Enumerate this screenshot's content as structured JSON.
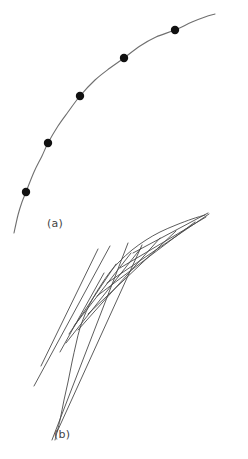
{
  "figure": {
    "title": "",
    "background_color": "#ffffff",
    "width": 248,
    "height": 459,
    "panels": [
      {
        "id": "a",
        "label": "(a)",
        "label_position": {
          "x": 47,
          "y": 217
        },
        "description": "smooth concave curve with sampled marker points"
      },
      {
        "id": "b",
        "label": "(b)",
        "label_position": {
          "x": 54,
          "y": 428
        },
        "description": "same curve approximated by overlapping tangent line segments"
      }
    ]
  },
  "chart_data": {
    "type": "line",
    "title": "",
    "xlabel": "",
    "ylabel": "",
    "grid": false,
    "legend": false,
    "axis_shown": false,
    "xlim": [
      0,
      248
    ],
    "ylim": [
      0,
      459
    ],
    "series": [
      {
        "name": "curve-a",
        "panel": "a",
        "stroke": "#6f6f6f",
        "stroke_width": 1.1,
        "kind": "smooth-curve",
        "points": [
          [
            14,
            233
          ],
          [
            18,
            215
          ],
          [
            22,
            202
          ],
          [
            26,
            192
          ],
          [
            34,
            172
          ],
          [
            42,
            156
          ],
          [
            48,
            143
          ],
          [
            58,
            126
          ],
          [
            68,
            112
          ],
          [
            80,
            96
          ],
          [
            95,
            80
          ],
          [
            110,
            68
          ],
          [
            124,
            58
          ],
          [
            140,
            46
          ],
          [
            156,
            37
          ],
          [
            175,
            30
          ],
          [
            192,
            22
          ],
          [
            205,
            17
          ],
          [
            215,
            14
          ]
        ]
      },
      {
        "name": "markers-a",
        "panel": "a",
        "kind": "scatter",
        "fill": "#111111",
        "radius": 4.2,
        "points": [
          [
            26,
            192
          ],
          [
            48,
            143
          ],
          [
            80,
            96
          ],
          [
            124,
            58
          ],
          [
            175,
            30
          ]
        ]
      },
      {
        "name": "curve-b",
        "panel": "b",
        "stroke": "#5d5d5d",
        "stroke_width": 1.0,
        "kind": "smooth-curve",
        "points": [
          [
            55,
            440
          ],
          [
            60,
            420
          ],
          [
            64,
            400
          ],
          [
            68,
            382
          ],
          [
            72,
            362
          ],
          [
            76,
            344
          ],
          [
            80,
            328
          ],
          [
            86,
            312
          ],
          [
            93,
            298
          ],
          [
            101,
            285
          ],
          [
            110,
            272
          ],
          [
            120,
            261
          ],
          [
            132,
            250
          ],
          [
            146,
            240
          ],
          [
            160,
            232
          ],
          [
            176,
            225
          ],
          [
            192,
            219
          ],
          [
            205,
            215
          ]
        ]
      },
      {
        "name": "tangents-b",
        "panel": "b",
        "kind": "segments",
        "stroke": "#4a4a4a",
        "stroke_width": 0.9,
        "segments": [
          [
            41,
            366,
            98,
            249
          ],
          [
            34,
            386,
            110,
            246
          ],
          [
            52,
            440,
            128,
            243
          ],
          [
            57,
            432,
            142,
            245
          ],
          [
            66,
            343,
            141,
            248
          ],
          [
            78,
            330,
            160,
            238
          ],
          [
            88,
            314,
            176,
            231
          ],
          [
            97,
            296,
            195,
            222
          ],
          [
            107,
            283,
            209,
            214
          ],
          [
            120,
            268,
            206,
            217
          ],
          [
            133,
            253,
            208,
            213
          ],
          [
            69,
            334,
            116,
            264
          ],
          [
            74,
            326,
            131,
            253
          ],
          [
            60,
            352,
            104,
            273
          ]
        ]
      }
    ]
  }
}
